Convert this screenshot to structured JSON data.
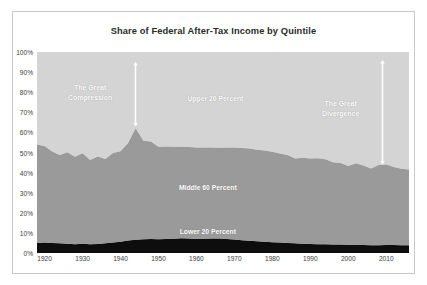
{
  "chart_data": {
    "type": "area",
    "stacked": true,
    "title": "Share of Federal After-Tax Income by Quintile",
    "xlabel": "",
    "ylabel": "",
    "xlim": [
      1918,
      2016
    ],
    "ylim": [
      0,
      100
    ],
    "grid": false,
    "legend_position": "none",
    "y_ticks": [
      "0%",
      "10%",
      "20%",
      "30%",
      "40%",
      "50%",
      "60%",
      "70%",
      "80%",
      "90%",
      "100%"
    ],
    "y_tick_values": [
      0,
      10,
      20,
      30,
      40,
      50,
      60,
      70,
      80,
      90,
      100
    ],
    "x_ticks": [
      "1920",
      "1930",
      "1940",
      "1950",
      "1960",
      "1970",
      "1980",
      "1990",
      "2000",
      "2010"
    ],
    "x_tick_values": [
      1920,
      1930,
      1940,
      1950,
      1960,
      1970,
      1980,
      1990,
      2000,
      2010
    ],
    "x": [
      1918,
      1920,
      1922,
      1924,
      1926,
      1928,
      1930,
      1932,
      1934,
      1936,
      1938,
      1940,
      1942,
      1944,
      1946,
      1948,
      1950,
      1952,
      1954,
      1956,
      1958,
      1960,
      1962,
      1964,
      1966,
      1968,
      1970,
      1972,
      1974,
      1976,
      1978,
      1980,
      1982,
      1984,
      1986,
      1988,
      1990,
      1992,
      1994,
      1996,
      1998,
      2000,
      2002,
      2004,
      2006,
      2008,
      2010,
      2012,
      2014,
      2016
    ],
    "series": [
      {
        "name": "Lower 20 Percent",
        "color": "#0d0d0d",
        "values": [
          5.0,
          5.2,
          5.0,
          4.8,
          4.6,
          4.4,
          4.6,
          4.3,
          4.5,
          4.8,
          5.2,
          5.6,
          6.2,
          6.6,
          6.9,
          7.0,
          6.8,
          7.0,
          7.1,
          7.3,
          7.2,
          7.0,
          7.1,
          7.2,
          7.2,
          7.0,
          6.7,
          6.4,
          6.1,
          5.8,
          5.6,
          5.4,
          5.2,
          5.0,
          4.8,
          4.6,
          4.5,
          4.4,
          4.3,
          4.2,
          4.2,
          4.1,
          4.1,
          4.0,
          3.9,
          3.9,
          4.0,
          4.0,
          3.9,
          3.9
        ]
      },
      {
        "name": "Middle 60 Percent",
        "color": "#9a9a9a",
        "values": [
          49.0,
          48.0,
          45.5,
          44.0,
          45.5,
          43.5,
          45.0,
          42.0,
          43.5,
          42.0,
          44.5,
          45.0,
          48.5,
          55.5,
          49.0,
          48.5,
          46.0,
          46.0,
          45.8,
          45.5,
          45.5,
          45.5,
          45.4,
          45.3,
          45.2,
          45.5,
          45.8,
          45.8,
          45.9,
          45.6,
          45.4,
          45.0,
          44.3,
          43.8,
          42.2,
          42.8,
          42.5,
          42.8,
          42.3,
          41.0,
          40.6,
          39.2,
          40.6,
          39.5,
          38.1,
          39.9,
          40.0,
          38.8,
          38.0,
          37.6
        ]
      },
      {
        "name": "Upper 20 Percent",
        "color": "#d4d4d4",
        "values": [
          46.0,
          46.8,
          49.5,
          51.2,
          49.9,
          52.1,
          50.4,
          53.7,
          52.0,
          53.2,
          50.3,
          49.4,
          45.3,
          37.9,
          44.1,
          44.5,
          47.2,
          47.0,
          47.1,
          47.2,
          47.3,
          47.5,
          47.5,
          47.5,
          47.6,
          47.5,
          47.5,
          47.8,
          48.0,
          48.6,
          49.0,
          49.6,
          50.5,
          51.2,
          53.0,
          52.6,
          53.0,
          52.8,
          53.4,
          54.8,
          55.2,
          56.7,
          55.3,
          56.5,
          58.0,
          56.2,
          56.0,
          57.2,
          58.1,
          58.5
        ]
      }
    ],
    "band_labels": [
      {
        "name": "upper-band-label",
        "text": "Upper 20 Percent",
        "x": 1965,
        "y": 77
      },
      {
        "name": "middle-band-label",
        "text": "Middle 60 Percent",
        "x": 1963,
        "y": 33
      },
      {
        "name": "lower-band-label",
        "text": "Lower 20 Percent",
        "x": 1963,
        "y": 11
      }
    ],
    "annotations": [
      {
        "name": "great-compression",
        "text": "The Great\nCompression",
        "arrow_x": 1944,
        "arrow_top": 95,
        "arrow_bottom": 63,
        "arrow_style": "double",
        "label_x": 1932,
        "label_y": 80,
        "color": "#ffffff"
      },
      {
        "name": "great-divergence",
        "text": "The Great\nDivergence",
        "arrow_x": 2009,
        "arrow_top": 96,
        "arrow_bottom": 44,
        "arrow_style": "double",
        "label_x": 1998,
        "label_y": 72,
        "color": "#ffffff"
      }
    ],
    "colors": {
      "upper": "#d4d4d4",
      "middle": "#9a9a9a",
      "lower": "#0d0d0d",
      "annotation": "#ffffff",
      "axis_text": "#3d3d3d",
      "title_text": "#2b2b2b",
      "frame_border": "#c9c9c9",
      "page_background": "#ffffff"
    }
  }
}
